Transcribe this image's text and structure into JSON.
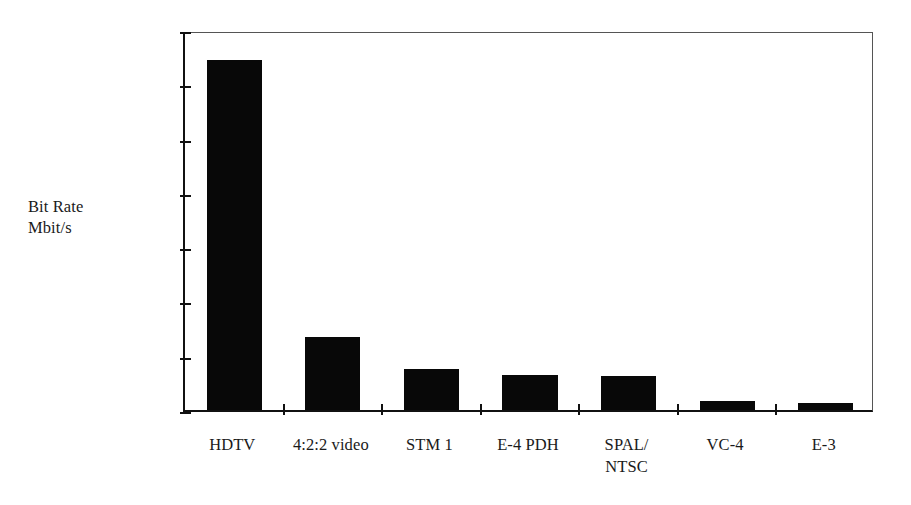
{
  "chart_data": {
    "type": "bar",
    "title": "",
    "subtitle": "",
    "xlabel": "",
    "ylabel": "Bit Rate\nMbit/s",
    "ylabel_lines": [
      "Bit Rate",
      "Mbit/s"
    ],
    "categories": [
      "HDTV",
      "4:2:2 video",
      "STM 1",
      "E-4 PDH",
      "SPAL/\nNTSC",
      "VC-4",
      "E-3"
    ],
    "category_lines": [
      [
        "HDTV"
      ],
      [
        "4:2:2 video"
      ],
      [
        "STM 1"
      ],
      [
        "E-4 PDH"
      ],
      [
        "SPAL/",
        "NTSC"
      ],
      [
        "VC-4"
      ],
      [
        "E-3"
      ]
    ],
    "values": [
      1288,
      270,
      150,
      128,
      125,
      34,
      25
    ],
    "unit": "Mbit/s",
    "ylim": [
      0,
      1400
    ],
    "ytick_values": [
      0,
      200,
      400,
      600,
      800,
      1000,
      1200,
      1400
    ],
    "ytick_labels": [
      "0",
      "200",
      "400",
      "600",
      "800",
      "1000",
      "1200",
      "1400"
    ],
    "grid": false,
    "legend": null,
    "legend_position": "none",
    "bar_color": "#080808",
    "axis_color": "#111111",
    "frame_color": "#555555",
    "background_color": "#ffffff",
    "text_color": "#1a1a1a"
  }
}
